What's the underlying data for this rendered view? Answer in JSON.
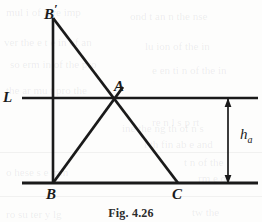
{
  "figure": {
    "caption": "Fig. 4.26",
    "stroke_color": "#1a1a1a",
    "background_color": "#fdfdfc"
  },
  "labels": {
    "line_l": "L",
    "apex_b_prime_base": "B",
    "apex_b_prime_mark": "′",
    "vertex_a": "A",
    "vertex_b": "B",
    "vertex_c": "C",
    "height_base": "h",
    "height_subscript": "a"
  },
  "geometry": {
    "line_l": {
      "x1": 22,
      "y1": 98,
      "x2": 258,
      "y2": 98
    },
    "base_line": {
      "x1": 22,
      "y1": 183,
      "x2": 258,
      "y2": 183
    },
    "segment_b_prime_b": {
      "x1": 53,
      "y1": 18,
      "x2": 53,
      "y2": 183
    },
    "segment_b_prime_c": {
      "x1": 53,
      "y1": 18,
      "x2": 178,
      "y2": 183
    },
    "segment_b_a": {
      "x1": 53,
      "y1": 183,
      "x2": 122,
      "y2": 88
    },
    "points": {
      "b_prime": {
        "x": 53,
        "y": 18
      },
      "a": {
        "x": 114,
        "y": 99
      },
      "b": {
        "x": 53,
        "y": 183
      },
      "c": {
        "x": 178,
        "y": 183
      }
    },
    "dimension_arrow": {
      "x": 228,
      "y_top": 99,
      "y_bottom": 183
    }
  },
  "ghost_marks": [
    {
      "text": "mul i of ll  re  imp",
      "x": 6,
      "y": 6
    },
    {
      "text": "ond  t  an  n  the  nse",
      "x": 130,
      "y": 10
    },
    {
      "text": "ver the  e  t  e in of an",
      "x": 4,
      "y": 36
    },
    {
      "text": "lu  ion   of  the  in",
      "x": 145,
      "y": 40
    },
    {
      "text": "so   erm in   of    the   pro",
      "x": 10,
      "y": 58
    },
    {
      "text": "e en  ti n  of   the  in",
      "x": 152,
      "y": 64
    },
    {
      "text": "the   ar    mu  t  pro   the",
      "x": 6,
      "y": 84
    },
    {
      "text": "re   n    l   s  p  rt",
      "x": 152,
      "y": 116
    },
    {
      "text": "ine  the  ng   th  of  n  s",
      "x": 122,
      "y": 122
    },
    {
      "text": "l  th  fin  ab  e  and",
      "x": 144,
      "y": 138
    },
    {
      "text": "t  n  of  the",
      "x": 184,
      "y": 156
    },
    {
      "text": "o   hese  s  e  mm",
      "x": 6,
      "y": 166
    },
    {
      "text": "rm      e  of",
      "x": 198,
      "y": 172
    },
    {
      "text": "ro   su    ter   y   lg",
      "x": 6,
      "y": 208
    },
    {
      "text": "tw    the",
      "x": 192,
      "y": 206
    }
  ],
  "ghost_rules": [
    {
      "x": 0,
      "y": 152,
      "width": 262
    },
    {
      "x": 0,
      "y": 196,
      "width": 262
    }
  ]
}
